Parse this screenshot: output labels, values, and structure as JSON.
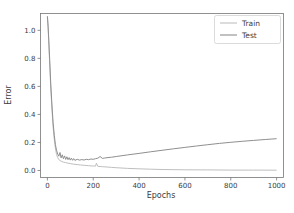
{
  "figure": {
    "background": "#ffffff"
  },
  "chart_data": {
    "type": "line",
    "title": "",
    "xlabel": "Epochs",
    "ylabel": "Error",
    "xlim": [
      -30,
      1030
    ],
    "ylim": [
      -0.05,
      1.12
    ],
    "xticks": [
      0,
      200,
      400,
      600,
      800,
      1000
    ],
    "xtick_labels": [
      "0",
      "200",
      "400",
      "600",
      "800",
      "1000"
    ],
    "yticks": [
      0.0,
      0.2,
      0.4,
      0.6,
      0.8,
      1.0
    ],
    "ytick_labels": [
      "0.0",
      "0.2",
      "0.4",
      "0.6",
      "0.8",
      "1.0"
    ],
    "grid": false,
    "legend_position": "upper right",
    "axis_color": "#767676",
    "text_color": "#3c3c3c",
    "series": [
      {
        "name": "Train",
        "color": "#bfbfbf",
        "x": [
          0,
          3,
          6,
          10,
          15,
          20,
          25,
          30,
          35,
          40,
          45,
          50,
          60,
          70,
          80,
          90,
          100,
          115,
          130,
          145,
          160,
          180,
          200,
          210,
          214,
          220,
          240,
          260,
          280,
          300,
          350,
          400,
          450,
          500,
          600,
          700,
          800,
          900,
          1000
        ],
        "y": [
          1.1,
          1.02,
          0.9,
          0.76,
          0.58,
          0.43,
          0.31,
          0.22,
          0.16,
          0.115,
          0.092,
          0.078,
          0.066,
          0.06,
          0.056,
          0.052,
          0.049,
          0.045,
          0.042,
          0.039,
          0.037,
          0.034,
          0.032,
          0.031,
          0.052,
          0.03,
          0.027,
          0.025,
          0.022,
          0.02,
          0.015,
          0.012,
          0.009,
          0.007,
          0.005,
          0.004,
          0.003,
          0.003,
          0.002
        ]
      },
      {
        "name": "Test",
        "color": "#8f8f8f",
        "x": [
          0,
          3,
          6,
          10,
          15,
          20,
          25,
          30,
          35,
          40,
          45,
          50,
          55,
          60,
          65,
          70,
          75,
          80,
          85,
          90,
          95,
          100,
          105,
          110,
          115,
          120,
          130,
          140,
          150,
          160,
          170,
          180,
          190,
          200,
          210,
          220,
          230,
          240,
          250,
          260,
          280,
          300,
          350,
          400,
          450,
          500,
          550,
          600,
          650,
          700,
          750,
          800,
          850,
          900,
          950,
          1000
        ],
        "y": [
          1.1,
          1.03,
          0.93,
          0.79,
          0.61,
          0.46,
          0.34,
          0.25,
          0.185,
          0.145,
          0.118,
          0.102,
          0.128,
          0.09,
          0.112,
          0.084,
          0.104,
          0.079,
          0.098,
          0.077,
          0.092,
          0.074,
          0.088,
          0.073,
          0.085,
          0.072,
          0.08,
          0.074,
          0.078,
          0.075,
          0.08,
          0.077,
          0.082,
          0.08,
          0.084,
          0.088,
          0.1,
          0.086,
          0.089,
          0.091,
          0.095,
          0.1,
          0.111,
          0.122,
          0.133,
          0.144,
          0.155,
          0.165,
          0.175,
          0.184,
          0.193,
          0.201,
          0.208,
          0.215,
          0.221,
          0.227
        ]
      }
    ]
  }
}
